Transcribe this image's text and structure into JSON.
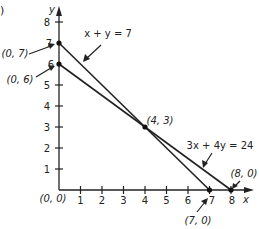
{
  "figure": {
    "corner_mark": ")",
    "axes": {
      "x_label": "x",
      "y_label": "y",
      "x_ticks": [
        "1",
        "2",
        "3",
        "4",
        "5",
        "6",
        "7",
        "8"
      ],
      "y_ticks": [
        "1",
        "2",
        "3",
        "4",
        "5",
        "6",
        "7",
        "8"
      ],
      "origin_label": "(0, 0)"
    },
    "lines": [
      {
        "equation": "x + y = 7",
        "from": [
          0,
          7
        ],
        "to": [
          7,
          0
        ]
      },
      {
        "equation": "3x + 4y = 24",
        "from": [
          0,
          6
        ],
        "to": [
          8,
          0
        ]
      }
    ],
    "points": [
      {
        "label": "(0, 7)",
        "x": 0,
        "y": 7
      },
      {
        "label": "(0, 6)",
        "x": 0,
        "y": 6
      },
      {
        "label": "(4, 3)",
        "x": 4,
        "y": 3
      },
      {
        "label": "(7, 0)",
        "x": 7,
        "y": 0
      },
      {
        "label": "(8, 0)",
        "x": 8,
        "y": 0
      }
    ],
    "colors": {
      "ink": "#222222",
      "background": "#ffffff"
    }
  }
}
